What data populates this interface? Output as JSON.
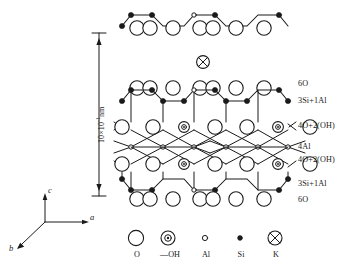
{
  "figure": {
    "type": "crystal-structure-diagram"
  },
  "dimension": {
    "label_text": "10×10",
    "exponent": "-1",
    "unit": "nm",
    "full_label": "10×10-1nm",
    "arrow_top_y": 33,
    "arrow_bottom_y": 196
  },
  "layer_labels": [
    {
      "id": "top-6O",
      "text": "6O",
      "y": 85
    },
    {
      "id": "top-3Si1Al",
      "text": "3Si+1Al",
      "y": 100
    },
    {
      "id": "top-4O2OH",
      "text": "4O+2(OH)",
      "y": 125
    },
    {
      "id": "mid-4Al",
      "text": "4Al",
      "y": 146
    },
    {
      "id": "bot-4O2OH",
      "text": "4O+2(OH)",
      "y": 159
    },
    {
      "id": "bot-3Si1Al",
      "text": "3Si+1Al",
      "y": 183
    },
    {
      "id": "bot-6O",
      "text": "6O",
      "y": 198
    }
  ],
  "legend": {
    "items": [
      {
        "id": "oxygen",
        "symbol": "large-open-circle",
        "label": "O",
        "x": 136
      },
      {
        "id": "hydroxyl",
        "symbol": "circle-with-inner-dot",
        "label": "—OH",
        "x": 168
      },
      {
        "id": "aluminium",
        "symbol": "small-open-circle",
        "label": "Al",
        "x": 205
      },
      {
        "id": "silicon",
        "symbol": "small-filled-dot",
        "label": "Si",
        "x": 240
      },
      {
        "id": "potassium",
        "symbol": "crossed-circle",
        "label": "K",
        "x": 275
      }
    ],
    "symbol_row_y": 238,
    "label_row_y": 256
  },
  "axes": {
    "origin": {
      "x": 45,
      "y": 222
    },
    "items": [
      {
        "id": "axis-c",
        "label": "c",
        "direction": "up",
        "tip": {
          "x": 45,
          "y": 194
        },
        "label_pos": {
          "x": 48,
          "y": 188
        }
      },
      {
        "id": "axis-a",
        "label": "a",
        "direction": "right",
        "tip": {
          "x": 88,
          "y": 222
        },
        "label_pos": {
          "x": 90,
          "y": 216
        }
      },
      {
        "id": "axis-b",
        "label": "b",
        "direction": "lower-left",
        "tip": {
          "x": 16,
          "y": 248
        },
        "label_pos": {
          "x": 10,
          "y": 248
        }
      }
    ]
  },
  "colors": {
    "stroke": "#1a1a1a",
    "fill_open": "#ffffff",
    "fill_solid": "#000000",
    "background": "#ffffff",
    "text": "#1a1a1a"
  },
  "structure": {
    "interlayer_cation": {
      "species": "K",
      "x": 203,
      "y": 62
    },
    "upper_fragment_y": 22,
    "sheet_top_y": 88,
    "sheet_bottom_y": 190,
    "repeat_units": 2,
    "unit_width": 68,
    "left_origin": 128
  }
}
